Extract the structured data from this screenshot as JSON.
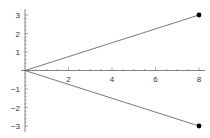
{
  "chart_data": {
    "type": "line",
    "title": "",
    "xlabel": "",
    "ylabel": "",
    "xlim": [
      0,
      8
    ],
    "ylim": [
      -3,
      3
    ],
    "grid": false,
    "legend": null,
    "x_ticks": [
      2,
      4,
      6,
      8
    ],
    "y_ticks": [
      -3,
      -2,
      -1,
      1,
      2,
      3
    ],
    "x_tick_labels": [
      "2",
      "4",
      "6",
      "8"
    ],
    "y_tick_labels": [
      "-3",
      "-2",
      "-1",
      "1",
      "2",
      "3"
    ],
    "series": [
      {
        "name": "upper",
        "x": [
          0,
          8
        ],
        "y": [
          0,
          3
        ],
        "endpoint_marker": true
      },
      {
        "name": "lower",
        "x": [
          0,
          8
        ],
        "y": [
          0,
          -3
        ],
        "endpoint_marker": true
      }
    ],
    "colors": {
      "line": "#555555",
      "axis": "#666666",
      "marker": "#000000"
    }
  }
}
